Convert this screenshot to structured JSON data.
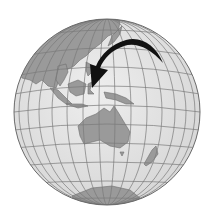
{
  "figure": {
    "arrow_target": "Indonesia / eastern archipelago",
    "colors": {
      "ocean": "#e6e6e6",
      "land": "#9a9a9a",
      "graticule": "#7a7a7a",
      "arrow": "#111111",
      "background": "#ffffff"
    },
    "regions": [
      "Asia",
      "Southeast Asia",
      "Japan",
      "Indonesia",
      "New Guinea",
      "Australia",
      "Tasmania",
      "New Zealand",
      "Antarctica"
    ]
  }
}
